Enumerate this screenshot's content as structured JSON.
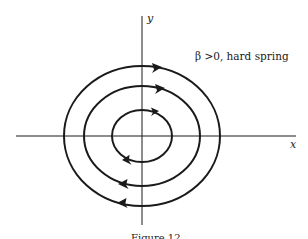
{
  "figure": {
    "axes": {
      "x_label": "x",
      "y_label": "y",
      "origin": [
        142,
        136
      ]
    },
    "annotation": "β >0, hard spring",
    "caption": "Figure 12",
    "orbits": [
      {
        "name": "outer",
        "rx": 78,
        "ry": 70,
        "direction": "clockwise"
      },
      {
        "name": "middle",
        "rx": 58,
        "ry": 50,
        "direction": "clockwise"
      },
      {
        "name": "inner",
        "rx": 30,
        "ry": 26,
        "direction": "clockwise"
      }
    ],
    "colors": {
      "stroke": "#1a1a1a",
      "background": "#ffffff"
    }
  }
}
